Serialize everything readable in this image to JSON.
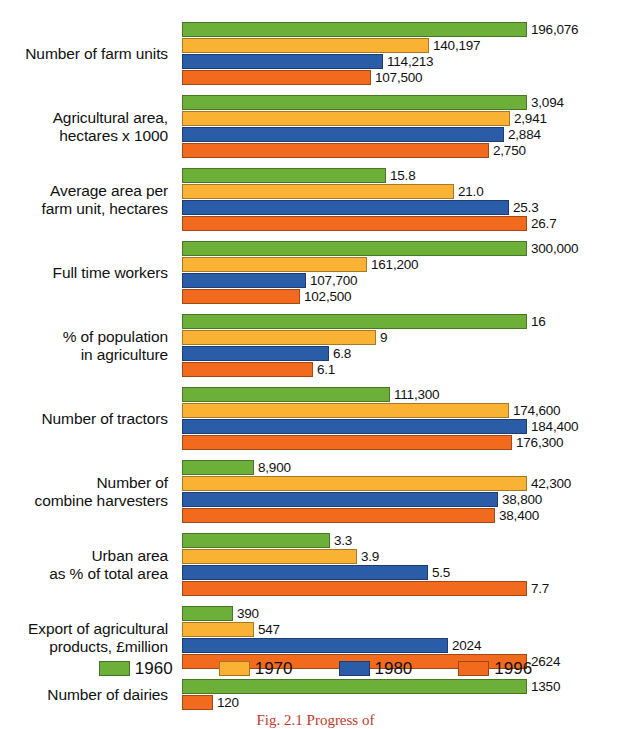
{
  "chart_data": {
    "type": "bar",
    "orientation": "horizontal",
    "title": "",
    "subtitle": "",
    "xlabel": "",
    "ylabel": "",
    "grid": false,
    "legend_position": "bottom",
    "note": "Grouped horizontal bar chart; each category group is drawn on its own independent scale (bar lengths are not comparable across groups).",
    "series": [
      {
        "name": "1960",
        "color": "#6CB03A"
      },
      {
        "name": "1970",
        "color": "#F9B233"
      },
      {
        "name": "1980",
        "color": "#2A5CA8"
      },
      {
        "name": "1996",
        "color": "#F26A1E"
      }
    ],
    "categories": [
      "Number of farm units",
      "Agricultural area, hectares x 1000",
      "Average area per farm unit, hectares",
      "Full time workers",
      "% of population in agriculture",
      "Number of tractors",
      "Number of combine harvesters",
      "Urban area as % of total area",
      "Export of agricultural products, £million",
      "Number of dairies"
    ],
    "groups": [
      {
        "label": "Number of farm units",
        "label_lines": "Number of farm units",
        "bars": [
          {
            "series": "1960",
            "value": 196076,
            "label": "196,076",
            "pct": 100.0
          },
          {
            "series": "1970",
            "value": 140197,
            "label": "140,197",
            "pct": 71.5
          },
          {
            "series": "1980",
            "value": 114213,
            "label": "114,213",
            "pct": 58.3
          },
          {
            "series": "1996",
            "value": 107500,
            "label": "107,500",
            "pct": 54.8
          }
        ]
      },
      {
        "label": "Agricultural area, hectares x 1000",
        "label_lines": "Agricultural area,\nhectares x 1000",
        "bars": [
          {
            "series": "1960",
            "value": 3094,
            "label": "3,094",
            "pct": 100.0
          },
          {
            "series": "1970",
            "value": 2941,
            "label": "2,941",
            "pct": 95.1
          },
          {
            "series": "1980",
            "value": 2884,
            "label": "2,884",
            "pct": 93.2
          },
          {
            "series": "1996",
            "value": 2750,
            "label": "2,750",
            "pct": 88.9
          }
        ]
      },
      {
        "label": "Average area per farm unit, hectares",
        "label_lines": "Average area per\nfarm unit, hectares",
        "bars": [
          {
            "series": "1960",
            "value": 15.8,
            "label": "15.8",
            "pct": 59.2
          },
          {
            "series": "1970",
            "value": 21.0,
            "label": "21.0",
            "pct": 78.7
          },
          {
            "series": "1980",
            "value": 25.3,
            "label": "25.3",
            "pct": 94.8
          },
          {
            "series": "1996",
            "value": 26.7,
            "label": "26.7",
            "pct": 100.0
          }
        ]
      },
      {
        "label": "Full time workers",
        "label_lines": "Full time workers",
        "bars": [
          {
            "series": "1960",
            "value": 300000,
            "label": "300,000",
            "pct": 100.0
          },
          {
            "series": "1970",
            "value": 161200,
            "label": "161,200",
            "pct": 53.7
          },
          {
            "series": "1980",
            "value": 107700,
            "label": "107,700",
            "pct": 35.9
          },
          {
            "series": "1996",
            "value": 102500,
            "label": "102,500",
            "pct": 34.2
          }
        ]
      },
      {
        "label": "% of population in agriculture",
        "label_lines": "% of population\nin agriculture",
        "bars": [
          {
            "series": "1960",
            "value": 16,
            "label": "16",
            "pct": 100.0
          },
          {
            "series": "1970",
            "value": 9,
            "label": "9",
            "pct": 56.3
          },
          {
            "series": "1980",
            "value": 6.8,
            "label": "6.8",
            "pct": 42.5
          },
          {
            "series": "1996",
            "value": 6.1,
            "label": "6.1",
            "pct": 38.1
          }
        ]
      },
      {
        "label": "Number of tractors",
        "label_lines": "Number of tractors",
        "bars": [
          {
            "series": "1960",
            "value": 111300,
            "label": "111,300",
            "pct": 60.4
          },
          {
            "series": "1970",
            "value": 174600,
            "label": "174,600",
            "pct": 94.7
          },
          {
            "series": "1980",
            "value": 184400,
            "label": "184,400",
            "pct": 100.0
          },
          {
            "series": "1996",
            "value": 176300,
            "label": "176,300",
            "pct": 95.6
          }
        ]
      },
      {
        "label": "Number of combine harvesters",
        "label_lines": "Number of\ncombine harvesters",
        "bars": [
          {
            "series": "1960",
            "value": 8900,
            "label": "8,900",
            "pct": 21.0
          },
          {
            "series": "1970",
            "value": 42300,
            "label": "42,300",
            "pct": 100.0
          },
          {
            "series": "1980",
            "value": 38800,
            "label": "38,800",
            "pct": 91.7
          },
          {
            "series": "1996",
            "value": 38400,
            "label": "38,400",
            "pct": 90.8
          }
        ]
      },
      {
        "label": "Urban area as % of total area",
        "label_lines": "Urban area\nas % of total area",
        "bars": [
          {
            "series": "1960",
            "value": 3.3,
            "label": "3.3",
            "pct": 42.9
          },
          {
            "series": "1970",
            "value": 3.9,
            "label": "3.9",
            "pct": 50.6
          },
          {
            "series": "1980",
            "value": 5.5,
            "label": "5.5",
            "pct": 71.4
          },
          {
            "series": "1996",
            "value": 7.7,
            "label": "7.7",
            "pct": 100.0
          }
        ]
      },
      {
        "label": "Export of agricultural products, £million",
        "label_lines": "Export of agricultural\nproducts, £million",
        "bars": [
          {
            "series": "1960",
            "value": 390,
            "label": "390",
            "pct": 14.9
          },
          {
            "series": "1970",
            "value": 547,
            "label": "547",
            "pct": 20.8
          },
          {
            "series": "1980",
            "value": 2024,
            "label": "2024",
            "pct": 77.1
          },
          {
            "series": "1996",
            "value": 2624,
            "label": "2624",
            "pct": 100.0
          }
        ]
      },
      {
        "label": "Number of dairies",
        "label_lines": "Number of dairies",
        "bars": [
          {
            "series": "1960",
            "value": 1350,
            "label": "1350",
            "pct": 100.0
          },
          {
            "series": "1996",
            "value": 120,
            "label": "120",
            "pct": 8.9
          }
        ]
      }
    ]
  },
  "legend": {
    "items": [
      {
        "label": "1960",
        "color": "#6CB03A"
      },
      {
        "label": "1970",
        "color": "#F9B233"
      },
      {
        "label": "1980",
        "color": "#2A5CA8"
      },
      {
        "label": "1996",
        "color": "#F26A1E"
      }
    ]
  },
  "caption": {
    "text": "Fig. 2.1 Progress of",
    "color": "#C0392B"
  }
}
